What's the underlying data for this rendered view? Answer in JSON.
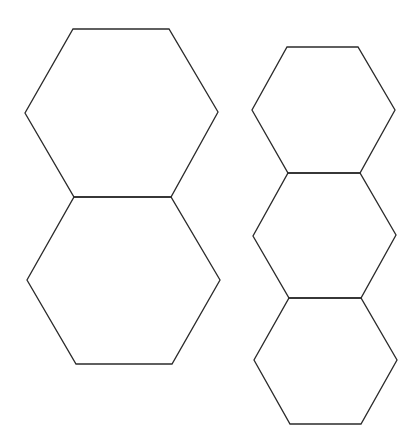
{
  "diagram": {
    "title": "",
    "background": "#ffffff",
    "stroke_color": "#2b2b2b",
    "stroke_width": 1.3,
    "groups": [
      {
        "name": "left-column",
        "arrangement": "two hexagons stacked vertically, sharing one horizontal edge",
        "shapes": [
          {
            "id": "left-top-hexagon",
            "type": "hexagon",
            "points": [
              [
                73,
                29
              ],
              [
                169,
                29
              ],
              [
                218,
                112
              ],
              [
                171,
                197
              ],
              [
                74,
                197
              ],
              [
                25,
                113
              ]
            ]
          },
          {
            "id": "left-bottom-hexagon",
            "type": "hexagon",
            "points": [
              [
                74,
                197
              ],
              [
                171,
                197
              ],
              [
                220,
                280
              ],
              [
                172,
                364
              ],
              [
                76,
                364
              ],
              [
                27,
                280
              ]
            ]
          }
        ]
      },
      {
        "name": "right-column",
        "arrangement": "three smaller hexagons stacked vertically, each sharing a horizontal edge with the next",
        "shapes": [
          {
            "id": "right-top-hexagon",
            "type": "hexagon",
            "points": [
              [
                287,
                47
              ],
              [
                358,
                47
              ],
              [
                395,
                110
              ],
              [
                360,
                173
              ],
              [
                288,
                173
              ],
              [
                252,
                110
              ]
            ]
          },
          {
            "id": "right-middle-hexagon",
            "type": "hexagon",
            "points": [
              [
                288,
                173
              ],
              [
                360,
                173
              ],
              [
                396,
                235
              ],
              [
                361,
                298
              ],
              [
                289,
                298
              ],
              [
                253,
                236
              ]
            ]
          },
          {
            "id": "right-bottom-hexagon",
            "type": "hexagon",
            "points": [
              [
                289,
                298
              ],
              [
                361,
                298
              ],
              [
                397,
                360
              ],
              [
                361,
                424
              ],
              [
                290,
                424
              ],
              [
                254,
                360
              ]
            ]
          }
        ]
      }
    ]
  }
}
